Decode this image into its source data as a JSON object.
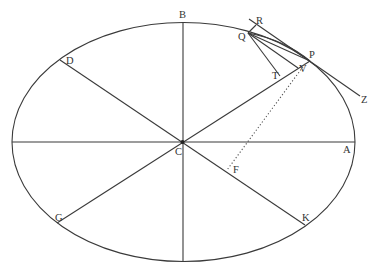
{
  "diagram": {
    "colors": {
      "line": "#3a3a3a",
      "label": "#333333",
      "background": "#ffffff"
    },
    "ellipse": {
      "cx": 183.5,
      "cy": 142,
      "rx": 171.5,
      "ry": 119.5
    },
    "labels": {
      "A": "A",
      "B": "B",
      "C": "C",
      "D": "D",
      "F": "F",
      "G": "G",
      "K": "K",
      "P": "P",
      "Q": "Q",
      "R": "R",
      "T": "T",
      "V": "V",
      "Z": "Z"
    }
  }
}
